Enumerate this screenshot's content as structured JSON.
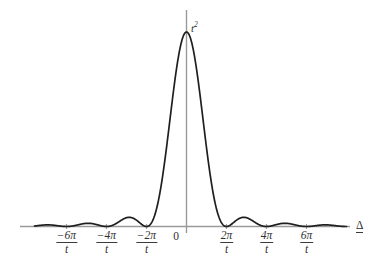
{
  "figure": {
    "background_color": "#ffffff",
    "curve_color": "#1f1f1f",
    "axis_color": "#9a9a9a",
    "text_color": "#2f2f2f",
    "width": 372,
    "height": 262
  },
  "axes": {
    "x_axis_label": "Δ",
    "y_peak_label": {
      "base": "t",
      "exponent": "2",
      "full": "t²"
    },
    "origin_label": "0"
  },
  "ticks": [
    {
      "label_num": "−6π",
      "label_den": "t",
      "value": -6,
      "x_px": 66
    },
    {
      "label_num": "−4π",
      "label_den": "t",
      "value": -4,
      "x_px": 106
    },
    {
      "label_num": "−2π",
      "label_den": "t",
      "value": -2,
      "x_px": 146
    },
    {
      "label_num": "2π",
      "label_den": "t",
      "value": 2,
      "x_px": 226
    },
    {
      "label_num": "4π",
      "label_den": "t",
      "value": 4,
      "x_px": 266
    },
    {
      "label_num": "6π",
      "label_den": "t",
      "value": 6,
      "x_px": 306
    }
  ],
  "chart_data": {
    "type": "line",
    "title": "",
    "subtitle": "",
    "xlabel": "Δ",
    "ylabel": "",
    "grid": false,
    "legend": null,
    "function": "t^2 * sinc^2(t*Δ/2) = t^2 * (sin(tΔ/2)/(tΔ/2))^2",
    "x_unit": "2π/t",
    "xlim": [
      -7.6,
      8.0
    ],
    "ylim": [
      0,
      1.08
    ],
    "x_tick_values": [
      -6,
      -4,
      -2,
      0,
      2,
      4,
      6
    ],
    "x_tick_labels": [
      "−6π/t",
      "−4π/t",
      "−2π/t",
      "0",
      "2π/t",
      "4π/t",
      "6π/t"
    ],
    "y_tick_values": [
      1
    ],
    "y_tick_labels": [
      "t²"
    ],
    "peak": {
      "x": 0,
      "y": 1,
      "label": "t²"
    },
    "zeros": [
      -6,
      -4,
      -2,
      2,
      4,
      6
    ],
    "side_lobe_maxima": [
      {
        "x": -5.0,
        "y": 0.0162
      },
      {
        "x": -3.0,
        "y": 0.045
      },
      {
        "x": -1.0,
        "y": 0.045
      },
      {
        "x": 1.0,
        "y": 0.045
      },
      {
        "x": 3.0,
        "y": 0.045
      },
      {
        "x": 5.0,
        "y": 0.0162
      }
    ],
    "series": [
      {
        "name": "t² sinc²(tΔ/2)",
        "color": "#1f1f1f",
        "x": [
          -7.6,
          -7.4,
          -7.2,
          -7.0,
          -6.8,
          -6.6,
          -6.4,
          -6.2,
          -6.0,
          -5.8,
          -5.6,
          -5.4,
          -5.2,
          -5.0,
          -4.8,
          -4.6,
          -4.4,
          -4.2,
          -4.0,
          -3.8,
          -3.6,
          -3.4,
          -3.2,
          -3.0,
          -2.8,
          -2.6,
          -2.4,
          -2.2,
          -2.0,
          -1.8,
          -1.6,
          -1.4,
          -1.2,
          -1.0,
          -0.8,
          -0.6,
          -0.4,
          -0.2,
          0.0,
          0.2,
          0.4,
          0.6,
          0.8,
          1.0,
          1.2,
          1.4,
          1.6,
          1.8,
          2.0,
          2.2,
          2.4,
          2.6,
          2.8,
          3.0,
          3.2,
          3.4,
          3.6,
          3.8,
          4.0,
          4.2,
          4.4,
          4.6,
          4.8,
          5.0,
          5.2,
          5.4,
          5.6,
          5.8,
          6.0,
          6.2,
          6.4,
          6.6,
          6.8,
          7.0,
          7.2,
          7.4,
          7.6,
          7.8,
          8.0
        ],
        "y": [
          0.006,
          0.009,
          0.0105,
          0.01,
          0.0077,
          0.0044,
          0.0014,
          0.0,
          0.0,
          0.0017,
          0.0055,
          0.0099,
          0.0137,
          0.0155,
          0.0148,
          0.0116,
          0.007,
          0.0024,
          0.0,
          0.0019,
          0.0079,
          0.0172,
          0.0277,
          0.0367,
          0.0413,
          0.0393,
          0.0304,
          0.0164,
          0.0,
          0.0195,
          0.066,
          0.1292,
          0.1968,
          0.2575,
          0.3024,
          0.3269,
          0.331,
          0.3175,
          0.292,
          0.3175,
          0.331,
          0.3269,
          0.3024,
          0.2575,
          0.1968,
          0.1292,
          0.066,
          0.0195,
          0.0,
          0.0164,
          0.0304,
          0.0393,
          0.0413,
          0.0367,
          0.0277,
          0.0172,
          0.0079,
          0.0019,
          0.0,
          0.0024,
          0.007,
          0.0116,
          0.0148,
          0.0155,
          0.0137,
          0.0099,
          0.0055,
          0.0017,
          0.0,
          0.0014,
          0.0044,
          0.0077,
          0.01,
          0.0105,
          0.009,
          0.006,
          0.0028,
          0.0005,
          0.0
        ]
      }
    ]
  }
}
